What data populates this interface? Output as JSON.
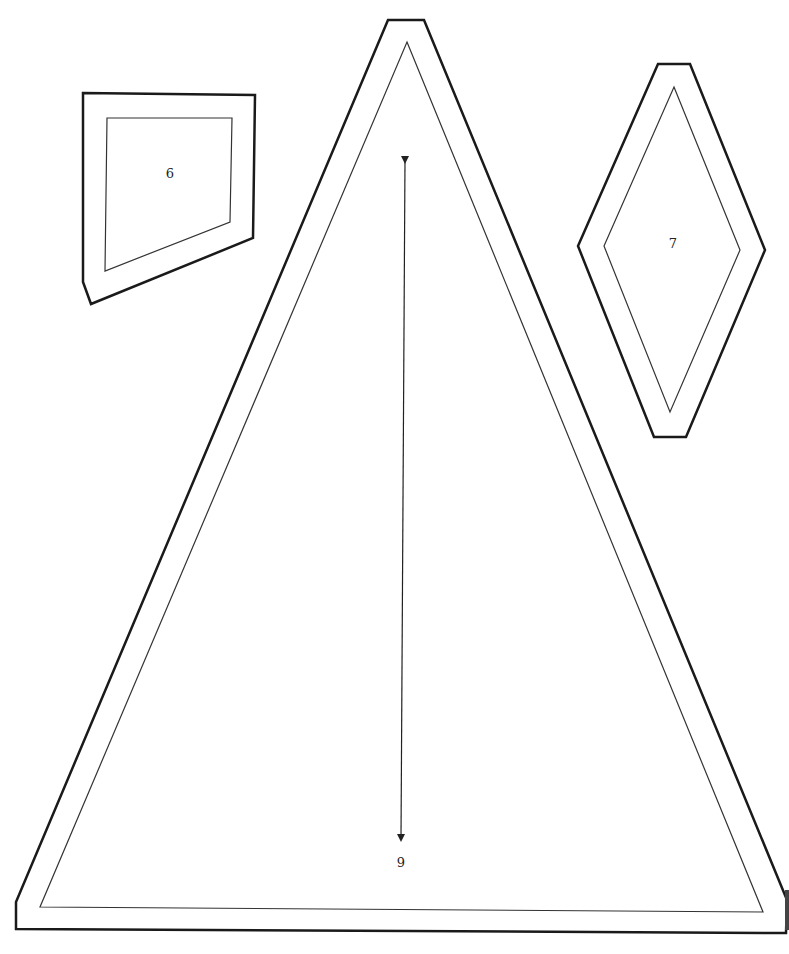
{
  "pieces": [
    {
      "id": "piece-6",
      "label": "6"
    },
    {
      "id": "piece-7",
      "label": "7"
    },
    {
      "id": "piece-9",
      "label": "9"
    }
  ],
  "colors": {
    "background": "#ffffff",
    "cut_line": "#1a1a1a",
    "seam_line": "#333333"
  }
}
